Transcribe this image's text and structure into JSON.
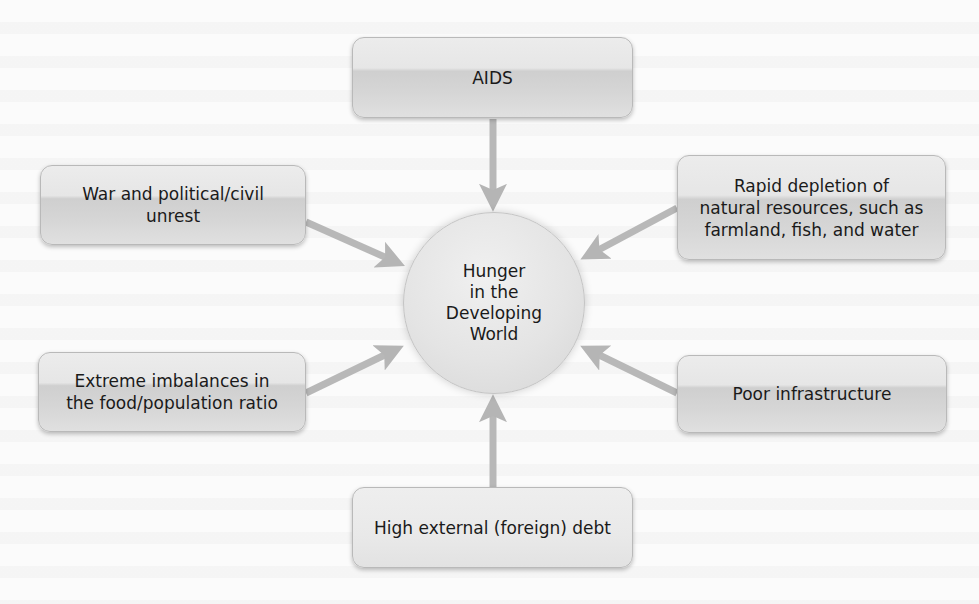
{
  "diagram": {
    "center": {
      "label": "Hunger\nin the\nDeveloping\nWorld"
    },
    "causes": [
      {
        "id": "aids",
        "label": "AIDS"
      },
      {
        "id": "war",
        "label": "War and political/civil\nunrest"
      },
      {
        "id": "depletion",
        "label": "Rapid depletion of\nnatural resources, such as\nfarmland, fish, and water"
      },
      {
        "id": "imbalance",
        "label": "Extreme imbalances in\nthe food/population ratio"
      },
      {
        "id": "infrastructure",
        "label": "Poor infrastructure"
      },
      {
        "id": "debt",
        "label": "High external (foreign) debt"
      }
    ],
    "arrow_color": "#b5b5b5"
  }
}
